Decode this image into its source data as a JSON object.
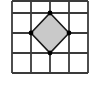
{
  "figure": {
    "canvas": {
      "width": 94,
      "height": 89,
      "background_color": "#ffffff"
    },
    "grid": {
      "rows": 4,
      "columns": 4,
      "line_color": "#3a3a3a",
      "line_width": 1.8,
      "x_positions": [
        12,
        31,
        50,
        69,
        88
      ],
      "y_positions": [
        13,
        33,
        53,
        73
      ],
      "top_border_y": 1,
      "cell_width": 19,
      "cell_height": 20
    },
    "shape": {
      "name": "diamond",
      "type": "rhombus",
      "fill_color": "#c9c9c9",
      "stroke_color": "#1a1a1a",
      "stroke_width": 1.6,
      "points": "50,13 69,33 50,53 31,33",
      "vertices": [
        {
          "label": "top-vertex",
          "x": 50,
          "y": 13
        },
        {
          "label": "right-vertex",
          "x": 69,
          "y": 33
        },
        {
          "label": "bottom-vertex",
          "x": 50,
          "y": 53
        },
        {
          "label": "left-vertex",
          "x": 31,
          "y": 33
        }
      ],
      "vertex_marker": {
        "color": "#000000",
        "radius": 2.4
      }
    }
  }
}
